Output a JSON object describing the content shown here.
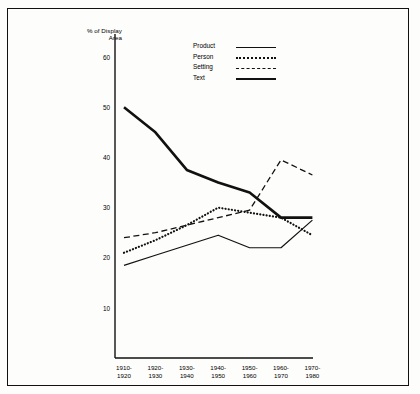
{
  "figure": {
    "y_axis_label": "% of Display\nArea"
  },
  "legend": {
    "items": [
      {
        "label": "Product",
        "style": "solid"
      },
      {
        "label": "Person",
        "style": "dotted"
      },
      {
        "label": "Setting",
        "style": "dashed"
      },
      {
        "label": "Text",
        "style": "thick-solid"
      }
    ]
  },
  "axes": {
    "yticks": [
      "10",
      "20",
      "30",
      "40",
      "50",
      "60"
    ],
    "xticks": [
      "1910-\n1920",
      "1920-\n1930",
      "1930-\n1940",
      "1940-\n1950",
      "1950-\n1960",
      "1960-\n1970",
      "1970-\n1980"
    ]
  },
  "chart_data": {
    "type": "line",
    "title": "",
    "xlabel": "",
    "ylabel": "% of Display Area",
    "categories": [
      "1910-1920",
      "1920-1930",
      "1930-1940",
      "1940-1950",
      "1950-1960",
      "1960-1970",
      "1970-1980"
    ],
    "ylim": [
      0,
      62
    ],
    "yticks": [
      10,
      20,
      30,
      40,
      50,
      60
    ],
    "grid": false,
    "legend_position": "top-center",
    "series": [
      {
        "name": "Product",
        "style": "solid",
        "values": [
          18.5,
          20.5,
          22.5,
          24.5,
          22.0,
          22.0,
          27.5
        ]
      },
      {
        "name": "Person",
        "style": "dotted",
        "values": [
          21.0,
          23.5,
          26.5,
          30.0,
          29.0,
          28.0,
          24.5
        ]
      },
      {
        "name": "Setting",
        "style": "dashed",
        "values": [
          24.0,
          25.0,
          26.5,
          28.0,
          29.5,
          39.5,
          36.5
        ]
      },
      {
        "name": "Text",
        "style": "thick-solid",
        "values": [
          50.0,
          45.0,
          37.5,
          35.0,
          33.0,
          28.0,
          28.0
        ]
      }
    ]
  }
}
